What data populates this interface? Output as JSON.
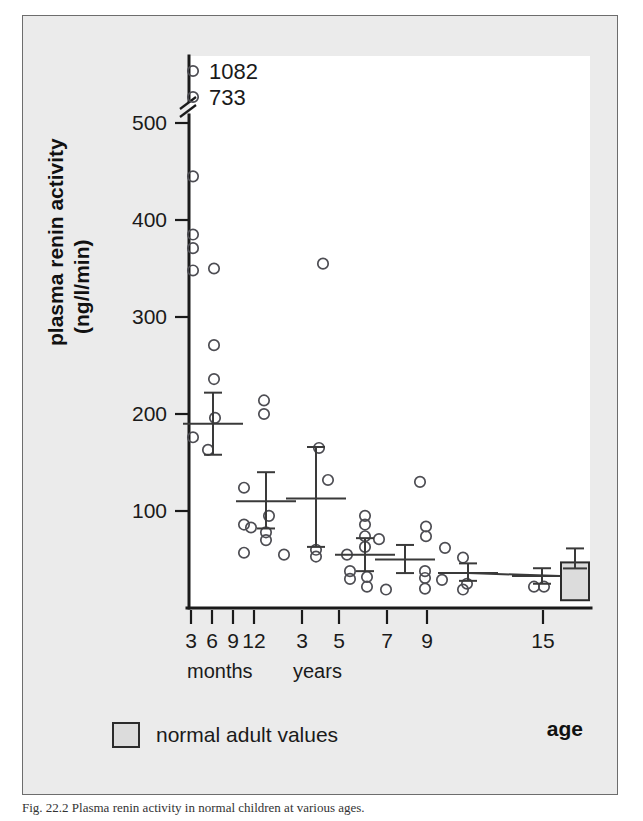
{
  "figure": {
    "background_color": "#ebebeb",
    "plot_background_color": "#ffffff",
    "frame_color": "#6d6d6d"
  },
  "axis_titles": {
    "y_line1": "plasma renin activity",
    "y_line2": "(ng/l/min)",
    "x_label": "age",
    "x_group_months": "months",
    "x_group_years": "years"
  },
  "legend": {
    "adult_label": "normal adult values",
    "swatch_color": "#dcdcdc"
  },
  "caption": "Fig. 22.2  Plasma renin activity in normal children at various ages.",
  "chart_data": {
    "type": "scatter",
    "title": "",
    "xlabel": "age",
    "ylabel": "plasma renin activity (ng/l/min)",
    "ylim": [
      0,
      520
    ],
    "yticks": [
      100,
      200,
      300,
      400,
      500
    ],
    "y_axis_break": true,
    "y_axis_break_value": 515,
    "grid": false,
    "legend_position": "bottom-left",
    "xticks": [
      {
        "label": "3",
        "group": "months",
        "px": 190
      },
      {
        "label": "6",
        "group": "months",
        "px": 211
      },
      {
        "label": "9",
        "group": "months",
        "px": 232
      },
      {
        "label": "12",
        "group": "months",
        "px": 253
      },
      {
        "label": "3",
        "group": "years",
        "px": 301
      },
      {
        "label": "5",
        "group": "years",
        "px": 338
      },
      {
        "label": "7",
        "group": "years",
        "px": 386
      },
      {
        "label": "9",
        "group": "years",
        "px": 426
      },
      {
        "label": "15",
        "group": "years",
        "px": 542
      }
    ],
    "outlier_labels": [
      {
        "text": "1082",
        "x_px": 192,
        "y_px": 70
      },
      {
        "text": "733",
        "x_px": 192,
        "y_px": 96
      }
    ],
    "groups": [
      {
        "name": "3 months",
        "mean": 190,
        "sem_low": 158,
        "sem_high": 222,
        "mean_x_px": 212,
        "points": [
          {
            "x_px": 192,
            "y": 1082,
            "offscale": true
          },
          {
            "x_px": 192,
            "y": 733,
            "offscale": true
          },
          {
            "x_px": 192,
            "y": 445
          },
          {
            "x_px": 192,
            "y": 385
          },
          {
            "x_px": 192,
            "y": 371
          },
          {
            "x_px": 192,
            "y": 348
          },
          {
            "x_px": 213,
            "y": 350
          },
          {
            "x_px": 213,
            "y": 271
          },
          {
            "x_px": 213,
            "y": 236
          },
          {
            "x_px": 214,
            "y": 196
          },
          {
            "x_px": 192,
            "y": 176
          },
          {
            "x_px": 207,
            "y": 163
          }
        ]
      },
      {
        "name": "9-12 months",
        "mean": 110,
        "sem_low": 82,
        "sem_high": 140,
        "mean_x_px": 265,
        "points": [
          {
            "x_px": 263,
            "y": 214
          },
          {
            "x_px": 263,
            "y": 200
          },
          {
            "x_px": 243,
            "y": 124
          },
          {
            "x_px": 268,
            "y": 95
          },
          {
            "x_px": 243,
            "y": 86
          },
          {
            "x_px": 250,
            "y": 83
          },
          {
            "x_px": 265,
            "y": 78
          },
          {
            "x_px": 265,
            "y": 70
          },
          {
            "x_px": 243,
            "y": 57
          },
          {
            "x_px": 283,
            "y": 55
          }
        ]
      },
      {
        "name": "3 years",
        "mean": 113,
        "sem_low": 63,
        "sem_high": 166,
        "mean_x_px": 315,
        "points": [
          {
            "x_px": 322,
            "y": 355
          },
          {
            "x_px": 318,
            "y": 165
          },
          {
            "x_px": 327,
            "y": 132
          },
          {
            "x_px": 315,
            "y": 60
          },
          {
            "x_px": 315,
            "y": 53
          }
        ]
      },
      {
        "name": "5 years",
        "mean": 55,
        "sem_low": 38,
        "sem_high": 72,
        "mean_x_px": 364,
        "points": [
          {
            "x_px": 364,
            "y": 95
          },
          {
            "x_px": 364,
            "y": 86
          },
          {
            "x_px": 364,
            "y": 74
          },
          {
            "x_px": 364,
            "y": 63
          },
          {
            "x_px": 346,
            "y": 55
          },
          {
            "x_px": 378,
            "y": 71
          },
          {
            "x_px": 349,
            "y": 38
          },
          {
            "x_px": 349,
            "y": 30
          },
          {
            "x_px": 366,
            "y": 32
          },
          {
            "x_px": 366,
            "y": 22
          },
          {
            "x_px": 385,
            "y": 19
          }
        ]
      },
      {
        "name": "7 years",
        "mean": 50,
        "sem_low": 36,
        "sem_high": 65,
        "mean_x_px": 404,
        "points": [
          {
            "x_px": 419,
            "y": 130
          },
          {
            "x_px": 425,
            "y": 84
          },
          {
            "x_px": 425,
            "y": 74
          },
          {
            "x_px": 444,
            "y": 62
          },
          {
            "x_px": 424,
            "y": 38
          },
          {
            "x_px": 424,
            "y": 31
          },
          {
            "x_px": 424,
            "y": 20
          },
          {
            "x_px": 441,
            "y": 29
          }
        ]
      },
      {
        "name": "9 years",
        "mean": 36,
        "sem_low": 28,
        "sem_high": 46,
        "mean_x_px": 467,
        "points": [
          {
            "x_px": 462,
            "y": 52
          },
          {
            "x_px": 466,
            "y": 25
          },
          {
            "x_px": 462,
            "y": 19
          }
        ]
      },
      {
        "name": "15 years",
        "mean": 33,
        "sem_low": 25,
        "sem_high": 41,
        "mean_x_px": 541,
        "points": [
          {
            "x_px": 533,
            "y": 22
          },
          {
            "x_px": 543,
            "y": 22
          }
        ]
      }
    ],
    "adult_reference": {
      "label": "normal adult values",
      "mean": 30,
      "range_low": 8,
      "range_high": 47,
      "box_x_px": 560,
      "box_width_px": 28,
      "fill": "#dcdcdc"
    }
  }
}
